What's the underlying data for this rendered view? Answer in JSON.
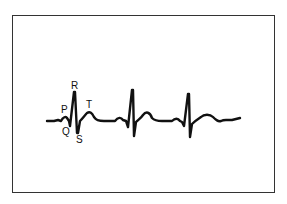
{
  "diagram": {
    "type": "ecg-waveform",
    "beats": 3,
    "labels": {
      "p": "P",
      "q": "Q",
      "r": "R",
      "s": "S",
      "t": "T"
    },
    "colors": {
      "trace": "#111111",
      "frame": "#333333",
      "background": "#ffffff"
    }
  }
}
